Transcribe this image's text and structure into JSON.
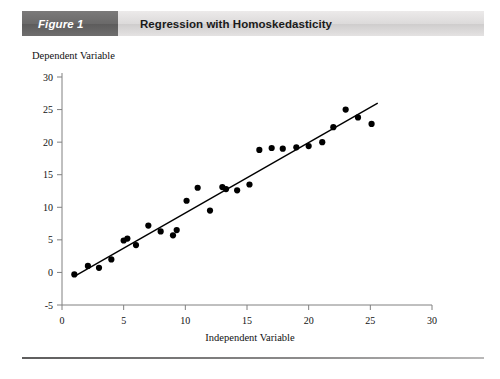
{
  "header": {
    "badge_label": "Figure 1",
    "title": "Regression with Homoskedasticity"
  },
  "axis_titles": {
    "y": "Dependent Variable",
    "x": "Independent Variable"
  },
  "colors": {
    "badge_bg": "#6a6969",
    "header_bg": "#dcdada",
    "point": "#000000",
    "line": "#000000",
    "axis": "#808080",
    "text": "#111111"
  },
  "chart_data": {
    "type": "scatter",
    "title": "Regression with Homoskedasticity",
    "xlabel": "Independent Variable",
    "ylabel": "Dependent Variable",
    "xlim": [
      0,
      30
    ],
    "ylim": [
      -5,
      30
    ],
    "xticks": [
      0,
      5,
      10,
      15,
      20,
      25,
      30
    ],
    "yticks": [
      -5,
      0,
      5,
      10,
      15,
      20,
      25,
      30
    ],
    "xtick_labels": [
      "0",
      "5",
      "10",
      "15",
      "20",
      "25",
      "30"
    ],
    "ytick_labels": [
      "-5",
      "0",
      "5",
      "10",
      "15",
      "20",
      "25",
      "30"
    ],
    "grid": false,
    "legend": false,
    "series": [
      {
        "name": "observations",
        "type": "scatter",
        "marker": "filled-circle",
        "color": "#000000",
        "points": [
          [
            1.0,
            -0.3
          ],
          [
            2.1,
            1.0
          ],
          [
            3.0,
            0.7
          ],
          [
            4.0,
            2.0
          ],
          [
            5.0,
            4.9
          ],
          [
            5.3,
            5.2
          ],
          [
            6.0,
            4.2
          ],
          [
            7.0,
            7.2
          ],
          [
            8.0,
            6.3
          ],
          [
            9.0,
            5.7
          ],
          [
            9.3,
            6.5
          ],
          [
            10.1,
            11.0
          ],
          [
            11.0,
            13.0
          ],
          [
            12.0,
            9.5
          ],
          [
            13.0,
            13.1
          ],
          [
            13.3,
            12.8
          ],
          [
            14.2,
            12.6
          ],
          [
            15.2,
            13.5
          ],
          [
            16.0,
            18.8
          ],
          [
            17.0,
            19.1
          ],
          [
            17.9,
            19.0
          ],
          [
            19.0,
            19.2
          ],
          [
            20.0,
            19.4
          ],
          [
            21.1,
            20.0
          ],
          [
            22.0,
            22.3
          ],
          [
            23.0,
            25.0
          ],
          [
            24.0,
            23.8
          ],
          [
            25.1,
            22.8
          ]
        ]
      },
      {
        "name": "regression-line",
        "type": "line",
        "color": "#000000",
        "x0": 1.0,
        "y0": -0.6,
        "x1": 25.6,
        "y1": 26.0
      }
    ]
  }
}
